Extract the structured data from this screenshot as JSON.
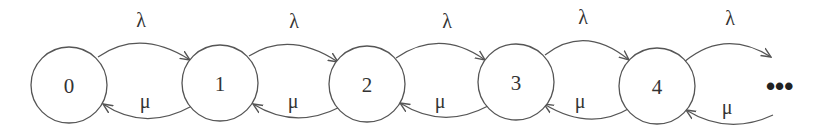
{
  "diagram": {
    "type": "birth-death-markov-chain",
    "states": [
      {
        "id": "0",
        "label": "0",
        "cx": 69,
        "cy": 85
      },
      {
        "id": "1",
        "label": "1",
        "cx": 220,
        "cy": 83
      },
      {
        "id": "2",
        "label": "2",
        "cx": 367,
        "cy": 84
      },
      {
        "id": "3",
        "label": "3",
        "cx": 516,
        "cy": 82
      },
      {
        "id": "4",
        "label": "4",
        "cx": 657,
        "cy": 86
      }
    ],
    "forward_rate_label": "λ",
    "backward_rate_label": "μ",
    "ellipsis": "•••",
    "edges": [
      {
        "from": "0",
        "to": "1",
        "label": "λ"
      },
      {
        "from": "1",
        "to": "0",
        "label": "μ"
      },
      {
        "from": "1",
        "to": "2",
        "label": "λ"
      },
      {
        "from": "2",
        "to": "1",
        "label": "μ"
      },
      {
        "from": "2",
        "to": "3",
        "label": "λ"
      },
      {
        "from": "3",
        "to": "2",
        "label": "μ"
      },
      {
        "from": "3",
        "to": "4",
        "label": "λ"
      },
      {
        "from": "4",
        "to": "3",
        "label": "μ"
      },
      {
        "from": "4",
        "to": "…",
        "label": "λ"
      },
      {
        "from": "…",
        "to": "4",
        "label": "μ"
      }
    ],
    "colors": {
      "stroke": "#555555",
      "text": "#333333",
      "background": "#ffffff"
    }
  }
}
